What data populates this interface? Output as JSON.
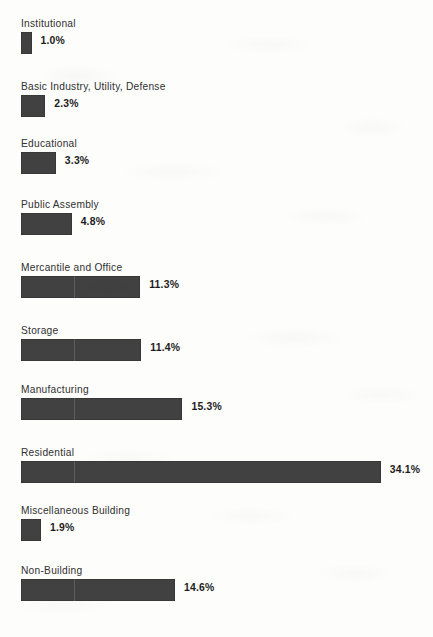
{
  "chart_data": {
    "type": "bar",
    "orientation": "horizontal",
    "title": "",
    "subtitle": "",
    "xlabel": "",
    "ylabel": "",
    "xlim": [
      0,
      34.1
    ],
    "grid": true,
    "gridlines_at": [
      5
    ],
    "legend": "none",
    "value_suffix": "%",
    "bar_color": "#414141",
    "background_color": "#fdfdfb",
    "categories": [
      "Institutional",
      "Basic Industry, Utility, Defense",
      "Educational",
      "Public Assembly",
      "Mercantile and Office",
      "Storage",
      "Manufacturing",
      "Residential",
      "Miscellaneous Building",
      "Non-Building"
    ],
    "values": [
      1.0,
      2.3,
      3.3,
      4.8,
      11.3,
      11.4,
      15.3,
      34.1,
      1.9,
      14.6
    ],
    "value_labels": [
      "1.0%",
      "2.3%",
      "3.3%",
      "4.8%",
      "11.3%",
      "11.4%",
      "15.3%",
      "34.1%",
      "1.9%",
      "14.6%"
    ]
  },
  "bars": [
    {
      "label": "Institutional",
      "value": 1.0,
      "value_label": "1.0%",
      "top": 18
    },
    {
      "label": "Basic Industry, Utility, Defense",
      "value": 2.3,
      "value_label": "2.3%",
      "top": 81
    },
    {
      "label": "Educational",
      "value": 3.3,
      "value_label": "3.3%",
      "top": 138
    },
    {
      "label": "Public Assembly",
      "value": 4.8,
      "value_label": "4.8%",
      "top": 199
    },
    {
      "label": "Mercantile and Office",
      "value": 11.3,
      "value_label": "11.3%",
      "top": 262
    },
    {
      "label": "Storage",
      "value": 11.4,
      "value_label": "11.4%",
      "top": 325
    },
    {
      "label": "Manufacturing",
      "value": 15.3,
      "value_label": "15.3%",
      "top": 384
    },
    {
      "label": "Residential",
      "value": 34.1,
      "value_label": "34.1%",
      "top": 447
    },
    {
      "label": "Miscellaneous Building",
      "value": 1.9,
      "value_label": "1.9%",
      "top": 505
    },
    {
      "label": "Non-Building",
      "value": 14.6,
      "value_label": "14.6%",
      "top": 565
    }
  ]
}
